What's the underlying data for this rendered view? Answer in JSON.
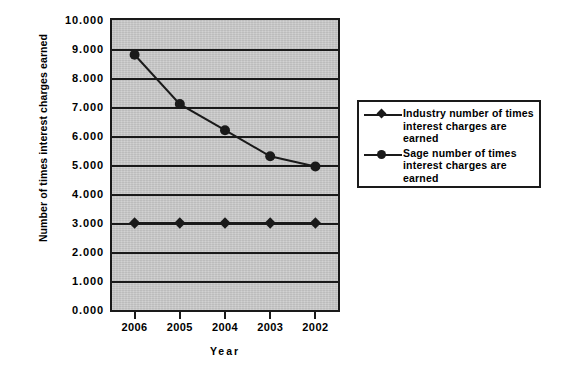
{
  "chart_data": {
    "type": "line",
    "title": "",
    "xlabel": "Year",
    "ylabel": "Number of times interest charges earned",
    "categories": [
      "2006",
      "2005",
      "2004",
      "2003",
      "2002"
    ],
    "ylim": [
      0,
      10
    ],
    "ytick_step": 1,
    "ytick_labels": [
      "10.000",
      "9.000",
      "8.000",
      "7.000",
      "6.000",
      "5.000",
      "4.000",
      "3.000",
      "2.000",
      "1.000",
      "0.000"
    ],
    "ytick_values": [
      10,
      9,
      8,
      7,
      6,
      5,
      4,
      3,
      2,
      1,
      0
    ],
    "grid": true,
    "legend_position": "right",
    "plot_background": "#c9c9c9",
    "series_color": "#1a1a1a",
    "series": [
      {
        "name": "Industry number of times interest charges are earned",
        "marker": "diamond",
        "values": [
          3.0,
          3.0,
          3.0,
          3.0,
          3.0
        ]
      },
      {
        "name": "Sage number of times interest charges are earned",
        "marker": "circle",
        "values": [
          8.8,
          7.1,
          6.2,
          5.3,
          4.95
        ]
      }
    ]
  },
  "legend": {
    "entries": [
      {
        "marker": "diamond",
        "label": "Industry number of times interest charges are earned"
      },
      {
        "marker": "circle",
        "label": "Sage number of times interest charges are earned"
      }
    ]
  }
}
